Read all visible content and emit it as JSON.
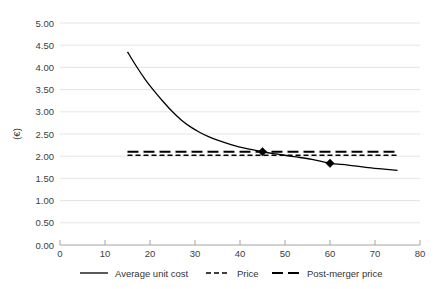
{
  "chart_data": {
    "type": "line",
    "title": "",
    "subtitle": "",
    "xlabel": "",
    "ylabel": "(€)",
    "xlim": [
      0,
      80
    ],
    "ylim": [
      0,
      5.0
    ],
    "grid": "horizontal",
    "legend_position": "bottom",
    "x_ticks": [
      "0",
      "10",
      "20",
      "30",
      "40",
      "50",
      "60",
      "70",
      "80"
    ],
    "x_tick_values": [
      0,
      10,
      20,
      30,
      40,
      50,
      60,
      70,
      80
    ],
    "y_ticks": [
      "0.00",
      "0.50",
      "1.00",
      "1.50",
      "2.00",
      "2.50",
      "3.00",
      "3.50",
      "4.00",
      "4.50",
      "5.00"
    ],
    "y_tick_values": [
      0,
      0.5,
      1.0,
      1.5,
      2.0,
      2.5,
      3.0,
      3.5,
      4.0,
      4.5,
      5.0
    ],
    "series": [
      {
        "name": "Average unit cost",
        "style": "solid",
        "color": "#000000",
        "x": [
          15,
          17,
          19,
          21,
          23,
          25,
          27,
          29,
          31,
          33,
          35,
          38,
          41,
          45,
          48,
          52,
          56,
          60,
          64,
          68,
          72,
          75
        ],
        "values": [
          4.35,
          4.02,
          3.72,
          3.46,
          3.22,
          3.0,
          2.81,
          2.66,
          2.54,
          2.44,
          2.36,
          2.26,
          2.18,
          2.1,
          2.05,
          1.99,
          1.93,
          1.84,
          1.8,
          1.75,
          1.71,
          1.68
        ]
      },
      {
        "name": "Price",
        "style": "short-dash",
        "color": "#000000",
        "x": [
          15,
          75
        ],
        "values": [
          2.02,
          2.02
        ]
      },
      {
        "name": "Post-merger price",
        "style": "long-dash",
        "color": "#000000",
        "x": [
          15,
          75
        ],
        "values": [
          2.1,
          2.1
        ]
      }
    ],
    "markers": [
      {
        "name": "pre-merger-equilibrium",
        "x": 45,
        "y": 2.1,
        "shape": "diamond"
      },
      {
        "name": "post-merger-equilibrium",
        "x": 60,
        "y": 1.84,
        "shape": "diamond"
      }
    ]
  },
  "legend": {
    "items": [
      {
        "label": "Average unit cost",
        "style": "solid"
      },
      {
        "label": "Price",
        "style": "short-dash"
      },
      {
        "label": "Post-merger price",
        "style": "long-dash"
      }
    ]
  }
}
